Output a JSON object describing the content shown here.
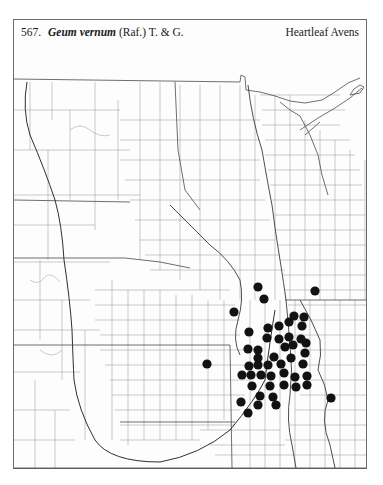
{
  "header": {
    "number": "567.",
    "scientific_name": "Geum vernum",
    "authority": "(Raf.) T. & G.",
    "common_name": "Heartleaf Avens"
  },
  "map": {
    "type": "county dot distribution map",
    "region": "Great Plains and upper Midwest, USA",
    "line_color": "#8a8a8a",
    "dot_color": "#121212",
    "background": "#ffffff"
  },
  "dots": [
    [
      258,
      287
    ],
    [
      264,
      299
    ],
    [
      315,
      291
    ],
    [
      234,
      312
    ],
    [
      294,
      316
    ],
    [
      304,
      317
    ],
    [
      289,
      322
    ],
    [
      279,
      326
    ],
    [
      302,
      326
    ],
    [
      268,
      328
    ],
    [
      249,
      332
    ],
    [
      267,
      338
    ],
    [
      279,
      339
    ],
    [
      289,
      337
    ],
    [
      301,
      339
    ],
    [
      306,
      343
    ],
    [
      248,
      349
    ],
    [
      258,
      350
    ],
    [
      285,
      347
    ],
    [
      293,
      345
    ],
    [
      305,
      353
    ],
    [
      258,
      358
    ],
    [
      274,
      357
    ],
    [
      291,
      358
    ],
    [
      207,
      364
    ],
    [
      249,
      366
    ],
    [
      258,
      365
    ],
    [
      268,
      365
    ],
    [
      281,
      364
    ],
    [
      303,
      364
    ],
    [
      242,
      375
    ],
    [
      251,
      375
    ],
    [
      261,
      375
    ],
    [
      271,
      376
    ],
    [
      284,
      373
    ],
    [
      295,
      377
    ],
    [
      307,
      376
    ],
    [
      252,
      386
    ],
    [
      270,
      386
    ],
    [
      284,
      385
    ],
    [
      296,
      387
    ],
    [
      307,
      385
    ],
    [
      260,
      396
    ],
    [
      273,
      397
    ],
    [
      241,
      402
    ],
    [
      258,
      405
    ],
    [
      276,
      405
    ],
    [
      248,
      413
    ],
    [
      331,
      398
    ]
  ]
}
